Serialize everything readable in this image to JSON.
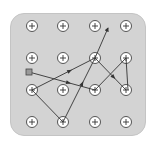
{
  "board": {
    "background": "#d3d3d3",
    "grid": {
      "columns_x": [
        32,
        63,
        95,
        126
      ],
      "rows_y": [
        26,
        58,
        90,
        122
      ],
      "node_symbol": "plus-circle"
    },
    "start_marker": {
      "x": 29,
      "y": 72,
      "shape": "square"
    },
    "path_segments": [
      {
        "from": [
          29,
          72
        ],
        "to": [
          95,
          90
        ],
        "arrow_mid": true
      },
      {
        "from": [
          95,
          90
        ],
        "to": [
          126,
          58
        ],
        "arrow_mid": false
      },
      {
        "from": [
          126,
          58
        ],
        "to": [
          128,
          90
        ],
        "arrow_mid": false
      },
      {
        "from": [
          95,
          58
        ],
        "to": [
          126,
          90
        ],
        "arrow_mid": true
      },
      {
        "from": [
          32,
          90
        ],
        "to": [
          95,
          58
        ],
        "arrow_mid": true
      },
      {
        "from": [
          32,
          90
        ],
        "to": [
          63,
          122
        ],
        "arrow_mid": false
      },
      {
        "from": [
          63,
          122
        ],
        "to": [
          95,
          58
        ],
        "arrow_mid": true
      },
      {
        "from": [
          95,
          58
        ],
        "to": [
          108,
          28
        ],
        "arrow_end": true
      }
    ],
    "line_color": "#333333"
  }
}
